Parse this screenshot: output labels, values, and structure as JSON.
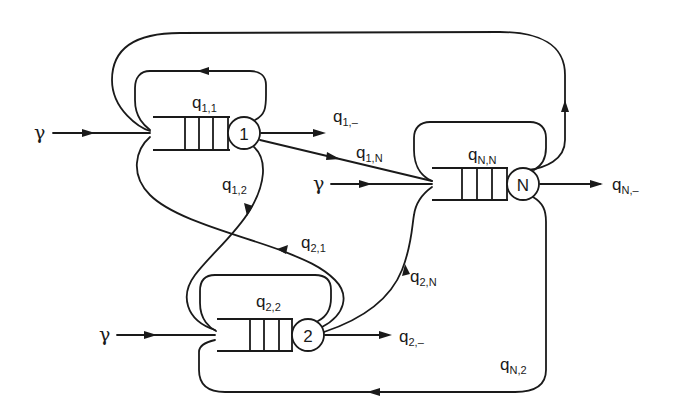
{
  "diagram": {
    "arrival_symbol": "γ",
    "nodes": [
      {
        "id": "1",
        "label": "1",
        "self_loop": "q",
        "self_loop_sub": "1,1",
        "exit": "q",
        "exit_sub": "1,–"
      },
      {
        "id": "2",
        "label": "2",
        "self_loop": "q",
        "self_loop_sub": "2,2",
        "exit": "q",
        "exit_sub": "2,–"
      },
      {
        "id": "N",
        "label": "N",
        "self_loop": "q",
        "self_loop_sub": "N,N",
        "exit": "q",
        "exit_sub": "N,–"
      }
    ],
    "edges": [
      {
        "from": "1",
        "to": "N",
        "label": "q",
        "sub": "1,N"
      },
      {
        "from": "1",
        "to": "2",
        "label": "q",
        "sub": "1,2"
      },
      {
        "from": "2",
        "to": "1",
        "label": "q",
        "sub": "2,1"
      },
      {
        "from": "2",
        "to": "N",
        "label": "q",
        "sub": "2,N"
      },
      {
        "from": "N",
        "to": "2",
        "label": "q",
        "sub": "N,2"
      },
      {
        "from": "N",
        "to": "1",
        "label": "",
        "sub": ""
      }
    ],
    "colors": {
      "stroke": "#1a1a1a",
      "background": "#ffffff"
    }
  }
}
